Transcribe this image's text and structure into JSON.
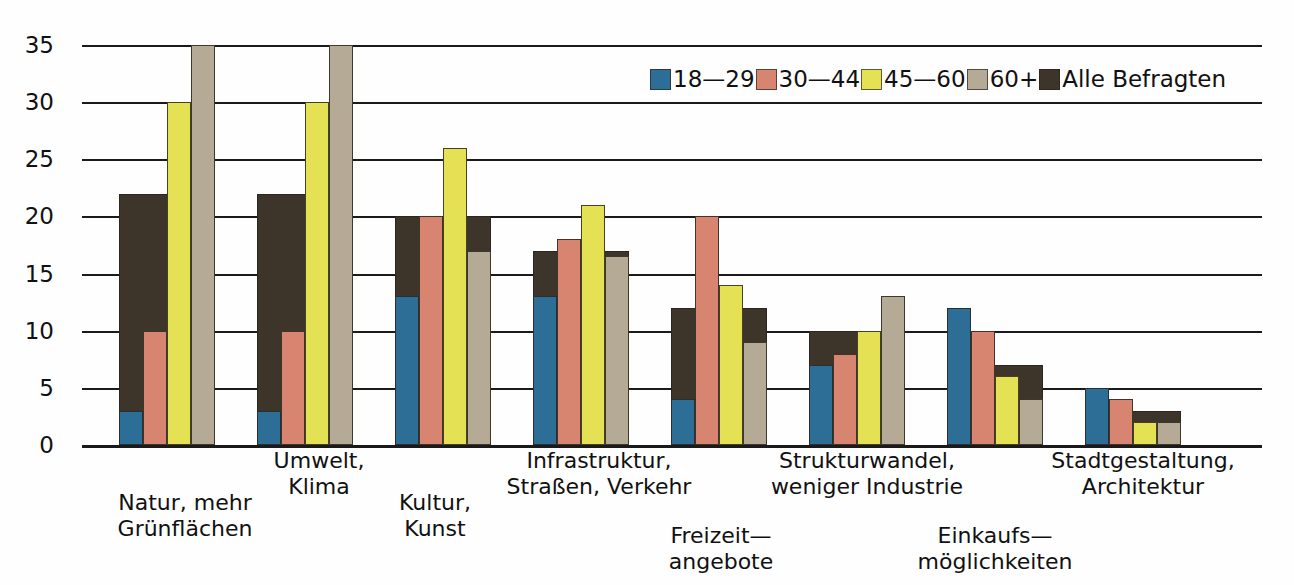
{
  "chart_data": {
    "type": "bar",
    "title": "",
    "xlabel": "",
    "ylabel": "",
    "ylim": [
      0,
      35
    ],
    "yticks": [
      0,
      5,
      10,
      15,
      20,
      25,
      30,
      35
    ],
    "grid": true,
    "legend_position": "top-center",
    "categories": [
      "Natur, mehr\nGrünflächen",
      "Umwelt,\nKlima",
      "Kultur,\nKunst",
      "Infrastruktur,\nStraßen, Verkehr",
      "Freizeit—\nangebote",
      "Strukturwandel,\nweniger Industrie",
      "Einkaufs—\nmöglichkeiten",
      "Stadtgestaltung,\nArchitektur"
    ],
    "category_lines": [
      [
        "Natur, mehr",
        "Grünflächen"
      ],
      [
        "Umwelt,",
        "Klima"
      ],
      [
        "Kultur,",
        "Kunst"
      ],
      [
        "Infrastruktur,",
        "Straßen, Verkehr"
      ],
      [
        "Freizeit—",
        "angebote"
      ],
      [
        "Strukturwandel,",
        "weniger Industrie"
      ],
      [
        "Einkaufs—",
        "möglichkeiten"
      ],
      [
        "Stadtgestaltung,",
        "Architektur"
      ]
    ],
    "series": [
      {
        "name": "18—29",
        "color": "#2c6e96",
        "values": [
          3,
          3,
          13,
          13,
          4,
          7,
          12,
          5
        ]
      },
      {
        "name": "30—44",
        "color": "#d78571",
        "values": [
          10,
          10,
          20,
          18,
          20,
          8,
          10,
          4
        ]
      },
      {
        "name": "45—60",
        "color": "#e4e254",
        "values": [
          30,
          30,
          26,
          21,
          14,
          10,
          6,
          2
        ]
      },
      {
        "name": "60+",
        "color": "#b4aa95",
        "values": [
          35,
          35,
          17,
          16.5,
          9,
          13,
          4,
          2
        ]
      },
      {
        "name": "Alle Befragten",
        "color": "#3d3529",
        "values": [
          22,
          22,
          20,
          17,
          12,
          10,
          7,
          3
        ]
      }
    ]
  },
  "axis": {
    "ytick_labels": [
      "0",
      "5",
      "10",
      "15",
      "20",
      "25",
      "30",
      "35"
    ]
  },
  "legend": {
    "items": [
      {
        "label": "18—29",
        "color": "#2c6e96"
      },
      {
        "label": "30—44",
        "color": "#d78571"
      },
      {
        "label": "45—60",
        "color": "#e4e254"
      },
      {
        "label": "60+",
        "color": "#b4aa95"
      },
      {
        "label": "Alle Befragten",
        "color": "#3d3529"
      }
    ]
  }
}
